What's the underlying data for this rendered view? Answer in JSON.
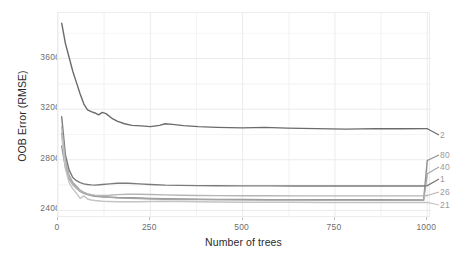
{
  "chart_data": {
    "type": "line",
    "title": "",
    "xlabel": "Number of trees",
    "ylabel": "OOB Error (RMSE)",
    "xlim": [
      0,
      1010
    ],
    "ylim": [
      23400,
      39600
    ],
    "xticks": [
      0,
      250,
      500,
      750,
      1000
    ],
    "xtick_labels": [
      "0",
      "250",
      "500",
      "750",
      "1000"
    ],
    "yticks": [
      24000,
      28000,
      32000,
      36000
    ],
    "ytick_labels": [
      "24000",
      "28000",
      "32000",
      "36000"
    ],
    "grid": true,
    "legend_position": "right-edge-line-labels",
    "series": [
      {
        "name": "2",
        "label": "2",
        "color": "#6b6b6b",
        "x": [
          10,
          20,
          30,
          40,
          50,
          60,
          70,
          80,
          90,
          100,
          110,
          120,
          130,
          145,
          160,
          180,
          200,
          225,
          250,
          275,
          290,
          310,
          340,
          380,
          430,
          500,
          560,
          620,
          700,
          780,
          860,
          930,
          1000
        ],
        "values": [
          38800,
          37200,
          36100,
          35000,
          34100,
          33200,
          32400,
          31950,
          31800,
          31700,
          31550,
          31750,
          31650,
          31300,
          31050,
          30850,
          30720,
          30680,
          30620,
          30720,
          30850,
          30800,
          30700,
          30620,
          30560,
          30520,
          30560,
          30500,
          30460,
          30420,
          30460,
          30450,
          30460
        ]
      },
      {
        "name": "80",
        "label": "80",
        "color": "#8f8f8f",
        "x": [
          10,
          20,
          30,
          40,
          50,
          60,
          70,
          80,
          90,
          100,
          120,
          140,
          160,
          190,
          220,
          250,
          290,
          330,
          380,
          430,
          500,
          570,
          640,
          720,
          800,
          880,
          950,
          990,
          1000
        ],
        "values": [
          29100,
          27400,
          26500,
          26050,
          25750,
          25500,
          25350,
          25250,
          25180,
          25120,
          25080,
          25050,
          25020,
          25000,
          24980,
          24950,
          24930,
          24900,
          24880,
          24870,
          24860,
          24850,
          24850,
          24840,
          24840,
          24840,
          24830,
          24830,
          27950
        ]
      },
      {
        "name": "40",
        "label": "40",
        "color": "#a5a5a5",
        "x": [
          10,
          20,
          30,
          40,
          50,
          60,
          70,
          80,
          90,
          100,
          120,
          140,
          160,
          190,
          220,
          250,
          290,
          330,
          380,
          430,
          500,
          570,
          640,
          720,
          800,
          880,
          950,
          990,
          1000
        ],
        "values": [
          30100,
          27900,
          26800,
          26200,
          25900,
          25600,
          25420,
          25300,
          25220,
          25150,
          25080,
          25030,
          24990,
          24960,
          24930,
          24900,
          24880,
          24860,
          24850,
          24840,
          24830,
          24820,
          24820,
          24810,
          24810,
          24800,
          24800,
          24800,
          26900
        ]
      },
      {
        "name": "1",
        "label": "1",
        "color": "#7a7a7a",
        "x": [
          10,
          20,
          30,
          40,
          50,
          60,
          70,
          80,
          90,
          100,
          120,
          140,
          160,
          190,
          220,
          250,
          290,
          330,
          380,
          430,
          500,
          570,
          640,
          720,
          800,
          880,
          950,
          990,
          1000
        ],
        "values": [
          31400,
          28400,
          27200,
          26600,
          26350,
          26200,
          26100,
          26050,
          26020,
          26000,
          26050,
          26100,
          26150,
          26150,
          26100,
          26050,
          26000,
          25980,
          25960,
          25950,
          25940,
          25940,
          25930,
          25930,
          25930,
          25930,
          25930,
          25930,
          25960
        ]
      },
      {
        "name": "26",
        "label": "26",
        "color": "#b5b5b5",
        "x": [
          10,
          20,
          30,
          40,
          50,
          60,
          70,
          80,
          90,
          100,
          120,
          140,
          160,
          190,
          220,
          250,
          290,
          330,
          380,
          430,
          500,
          570,
          640,
          720,
          800,
          880,
          950,
          990,
          1000
        ],
        "values": [
          30600,
          27800,
          26600,
          26050,
          25750,
          25550,
          25400,
          25300,
          25240,
          25200,
          25180,
          25200,
          25250,
          25280,
          25280,
          25260,
          25230,
          25200,
          25180,
          25170,
          25160,
          25160,
          25150,
          25150,
          25150,
          25150,
          25150,
          25150,
          25180
        ]
      },
      {
        "name": "21",
        "label": "21",
        "color": "#c4c4c4",
        "x": [
          10,
          20,
          30,
          40,
          50,
          60,
          70,
          80,
          90,
          100,
          120,
          140,
          160,
          190,
          220,
          250,
          290,
          330,
          380,
          430,
          500,
          570,
          640,
          720,
          800,
          880,
          950,
          990,
          1000
        ],
        "values": [
          29900,
          27300,
          26200,
          25700,
          25350,
          24950,
          25150,
          24900,
          24820,
          24780,
          24720,
          24700,
          24680,
          24680,
          24680,
          24700,
          24720,
          24700,
          24680,
          24660,
          24650,
          24640,
          24640,
          24630,
          24630,
          24630,
          24620,
          24620,
          24630
        ]
      }
    ],
    "series_end_labels": [
      {
        "label": "2",
        "top": 130,
        "color": "#9a9a9a"
      },
      {
        "label": "80",
        "top": 150,
        "color": "#9a9a9a"
      },
      {
        "label": "40",
        "top": 162,
        "color": "#9a9a9a"
      },
      {
        "label": "1",
        "top": 174,
        "color": "#9a9a9a"
      },
      {
        "label": "26",
        "top": 187,
        "color": "#9a9a9a"
      },
      {
        "label": "21",
        "top": 200,
        "color": "#9a9a9a"
      }
    ],
    "style": {
      "panel_background": "#ffffff",
      "grid_color": "#f2f2f2",
      "axis_text_color": "#6e6e6e",
      "axis_title_color": "#2b2b2b",
      "border_color": "#ededed"
    }
  }
}
